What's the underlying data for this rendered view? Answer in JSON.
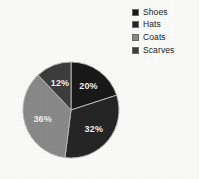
{
  "chart_data": {
    "type": "pie",
    "title": "",
    "categories": [
      "Shoes",
      "Hats",
      "Coats",
      "Scarves"
    ],
    "values": [
      20,
      32,
      36,
      12
    ],
    "value_labels": [
      "20%",
      "32%",
      "36%",
      "12%"
    ],
    "units": "percent",
    "start_angle_deg": 0,
    "direction": "clockwise",
    "colors": [
      "#191919",
      "#262626",
      "#8a8a8a",
      "#3d3d3d"
    ],
    "legend": {
      "position": "top-right",
      "entries": [
        {
          "label": "Shoes",
          "color": "#191919",
          "value_label": "20%"
        },
        {
          "label": "Hats",
          "color": "#262626",
          "value_label": "32%"
        },
        {
          "label": "Coats",
          "color": "#8a8a8a",
          "value_label": "36%"
        },
        {
          "label": "Scarves",
          "color": "#3d3d3d",
          "value_label": "12%"
        }
      ]
    },
    "label_color": "#f2f2f2",
    "background": "#fdfdfc",
    "grid": false,
    "xlabel": "",
    "ylabel": ""
  }
}
